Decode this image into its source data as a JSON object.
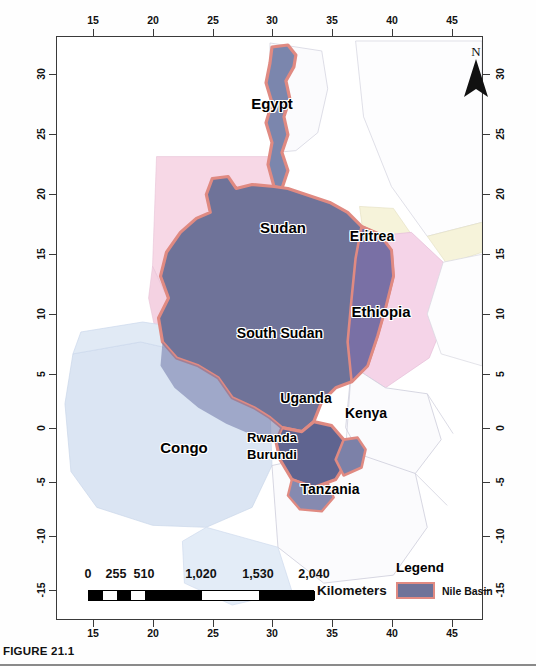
{
  "figure": {
    "caption": "FIGURE 21.1"
  },
  "map": {
    "north_arrow_label": "N",
    "axis": {
      "x_ticks": [
        "15",
        "20",
        "25",
        "30",
        "35",
        "40",
        "45"
      ],
      "y_ticks": [
        "30",
        "25",
        "20",
        "15",
        "10",
        "5",
        "0",
        "-5",
        "-10",
        "-15"
      ],
      "x_unit_note": "",
      "y_unit_note": ""
    },
    "country_labels": [
      {
        "name": "Egypt",
        "x": 272,
        "y": 103,
        "size": 15
      },
      {
        "name": "Sudan",
        "x": 283,
        "y": 227,
        "size": 15
      },
      {
        "name": "Eritrea",
        "x": 372,
        "y": 236,
        "size": 14
      },
      {
        "name": "Ethiopia",
        "x": 381,
        "y": 311,
        "size": 15
      },
      {
        "name": "South Sudan",
        "x": 280,
        "y": 333,
        "size": 14
      },
      {
        "name": "Uganda",
        "x": 306,
        "y": 398,
        "size": 14
      },
      {
        "name": "Kenya",
        "x": 366,
        "y": 413,
        "size": 14
      },
      {
        "name": "Congo",
        "x": 184,
        "y": 447,
        "size": 15
      },
      {
        "name": "Rwanda",
        "x": 272,
        "y": 437,
        "size": 13
      },
      {
        "name": "Burundi",
        "x": 272,
        "y": 454,
        "size": 13
      },
      {
        "name": "Tanzania",
        "x": 330,
        "y": 489,
        "size": 14
      }
    ],
    "scale_bar": {
      "labels": [
        "0",
        "255",
        "510",
        "1,020",
        "1,530",
        "2,040"
      ],
      "units": "Kilometers"
    },
    "legend": {
      "title": "Legend",
      "items": [
        {
          "label": "Nile Basin",
          "fill": "#6f7399",
          "stroke": "#e08a82"
        }
      ]
    },
    "colors": {
      "basin_fill": "#6f7399",
      "basin_fill_light": "#7b86ad",
      "basin_stroke": "#e08a82",
      "country_pink": "#f7d8e6",
      "country_pink_deep": "#f3cfe3",
      "country_blue": "#dbe5f3",
      "country_yellow": "#f6f3da",
      "country_white": "#fbfbfd",
      "border_gray": "#c9c9d4",
      "frame": "#3a3a3a",
      "text": "#111111"
    }
  }
}
